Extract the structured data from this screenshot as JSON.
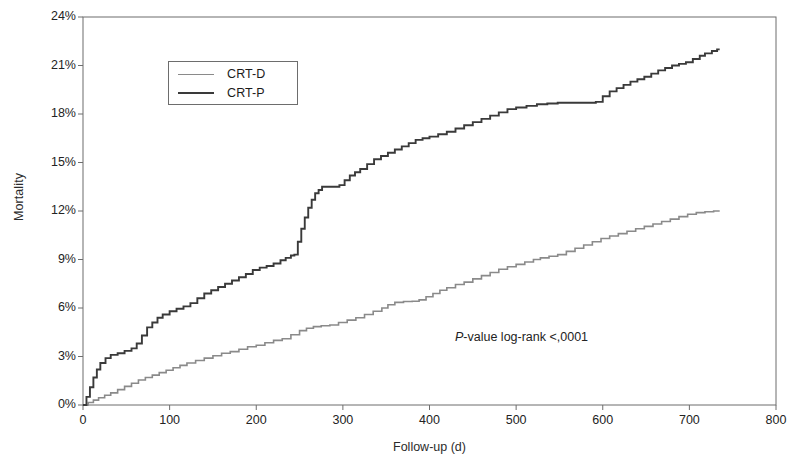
{
  "chart_data": {
    "type": "line",
    "title": "",
    "subtitle": "",
    "xlabel": "Follow-up (d)",
    "ylabel": "Mortality",
    "xlim": [
      0,
      800
    ],
    "ylim": [
      0,
      24
    ],
    "grid": false,
    "legend_position": "upper-left-inside",
    "xticks": [
      0,
      100,
      200,
      300,
      400,
      500,
      600,
      700,
      800
    ],
    "xtick_labels": [
      "0",
      "100",
      "200",
      "300",
      "400",
      "500",
      "600",
      "700",
      "800"
    ],
    "yticks": [
      0,
      3,
      6,
      9,
      12,
      15,
      18,
      21,
      24
    ],
    "ytick_labels": [
      "0%",
      "3%",
      "6%",
      "9%",
      "12%",
      "15%",
      "18%",
      "21%",
      "24%"
    ],
    "annotations": [
      {
        "name": "p-value-annotation",
        "text_italic": "P",
        "text": "-value log-rank  <,0001",
        "x": 430,
        "y": 3.9
      }
    ],
    "series": [
      {
        "name": "CRT-D",
        "color": "#8a8a8a",
        "linewidth": 1.6,
        "step": true,
        "points": [
          [
            0,
            0.0
          ],
          [
            6,
            0.15
          ],
          [
            12,
            0.3
          ],
          [
            18,
            0.45
          ],
          [
            25,
            0.6
          ],
          [
            32,
            0.75
          ],
          [
            40,
            0.95
          ],
          [
            48,
            1.15
          ],
          [
            56,
            1.35
          ],
          [
            64,
            1.55
          ],
          [
            72,
            1.7
          ],
          [
            80,
            1.85
          ],
          [
            88,
            2.0
          ],
          [
            96,
            2.15
          ],
          [
            104,
            2.3
          ],
          [
            112,
            2.45
          ],
          [
            120,
            2.6
          ],
          [
            130,
            2.75
          ],
          [
            140,
            2.9
          ],
          [
            150,
            3.05
          ],
          [
            160,
            3.2
          ],
          [
            170,
            3.3
          ],
          [
            180,
            3.45
          ],
          [
            190,
            3.6
          ],
          [
            200,
            3.7
          ],
          [
            210,
            3.85
          ],
          [
            220,
            4.0
          ],
          [
            230,
            4.1
          ],
          [
            240,
            4.35
          ],
          [
            250,
            4.6
          ],
          [
            258,
            4.75
          ],
          [
            266,
            4.85
          ],
          [
            275,
            4.9
          ],
          [
            285,
            4.95
          ],
          [
            295,
            5.1
          ],
          [
            305,
            5.25
          ],
          [
            315,
            5.4
          ],
          [
            325,
            5.6
          ],
          [
            335,
            5.8
          ],
          [
            345,
            6.0
          ],
          [
            352,
            6.2
          ],
          [
            360,
            6.35
          ],
          [
            370,
            6.4
          ],
          [
            380,
            6.42
          ],
          [
            388,
            6.5
          ],
          [
            396,
            6.7
          ],
          [
            404,
            6.9
          ],
          [
            412,
            7.1
          ],
          [
            420,
            7.25
          ],
          [
            430,
            7.45
          ],
          [
            440,
            7.6
          ],
          [
            450,
            7.8
          ],
          [
            460,
            8.0
          ],
          [
            470,
            8.2
          ],
          [
            480,
            8.4
          ],
          [
            490,
            8.55
          ],
          [
            500,
            8.7
          ],
          [
            510,
            8.85
          ],
          [
            520,
            9.0
          ],
          [
            528,
            9.1
          ],
          [
            538,
            9.2
          ],
          [
            548,
            9.3
          ],
          [
            558,
            9.5
          ],
          [
            568,
            9.7
          ],
          [
            578,
            9.9
          ],
          [
            588,
            10.1
          ],
          [
            598,
            10.3
          ],
          [
            608,
            10.45
          ],
          [
            618,
            10.6
          ],
          [
            628,
            10.75
          ],
          [
            638,
            10.9
          ],
          [
            648,
            11.05
          ],
          [
            658,
            11.2
          ],
          [
            668,
            11.35
          ],
          [
            678,
            11.5
          ],
          [
            688,
            11.65
          ],
          [
            698,
            11.8
          ],
          [
            708,
            11.9
          ],
          [
            718,
            11.95
          ],
          [
            728,
            12.0
          ],
          [
            735,
            12.0
          ]
        ]
      },
      {
        "name": "CRT-P",
        "color": "#3a3a3a",
        "linewidth": 1.9,
        "step": true,
        "points": [
          [
            0,
            0.0
          ],
          [
            4,
            0.5
          ],
          [
            8,
            1.1
          ],
          [
            12,
            1.7
          ],
          [
            16,
            2.2
          ],
          [
            20,
            2.6
          ],
          [
            26,
            2.9
          ],
          [
            32,
            3.1
          ],
          [
            40,
            3.2
          ],
          [
            48,
            3.35
          ],
          [
            56,
            3.5
          ],
          [
            62,
            3.8
          ],
          [
            68,
            4.3
          ],
          [
            74,
            4.8
          ],
          [
            80,
            5.1
          ],
          [
            86,
            5.4
          ],
          [
            92,
            5.6
          ],
          [
            100,
            5.8
          ],
          [
            108,
            5.95
          ],
          [
            116,
            6.1
          ],
          [
            124,
            6.3
          ],
          [
            132,
            6.6
          ],
          [
            140,
            6.9
          ],
          [
            148,
            7.1
          ],
          [
            156,
            7.3
          ],
          [
            164,
            7.5
          ],
          [
            172,
            7.7
          ],
          [
            180,
            7.9
          ],
          [
            188,
            8.1
          ],
          [
            196,
            8.35
          ],
          [
            204,
            8.5
          ],
          [
            212,
            8.6
          ],
          [
            220,
            8.75
          ],
          [
            228,
            8.95
          ],
          [
            234,
            9.1
          ],
          [
            240,
            9.25
          ],
          [
            244,
            9.3
          ],
          [
            248,
            10.1
          ],
          [
            252,
            10.9
          ],
          [
            256,
            11.6
          ],
          [
            260,
            12.2
          ],
          [
            264,
            12.7
          ],
          [
            268,
            13.1
          ],
          [
            272,
            13.3
          ],
          [
            276,
            13.5
          ],
          [
            285,
            13.5
          ],
          [
            292,
            13.5
          ],
          [
            296,
            13.6
          ],
          [
            302,
            13.9
          ],
          [
            308,
            14.2
          ],
          [
            314,
            14.4
          ],
          [
            320,
            14.6
          ],
          [
            328,
            14.9
          ],
          [
            336,
            15.2
          ],
          [
            344,
            15.4
          ],
          [
            352,
            15.6
          ],
          [
            360,
            15.8
          ],
          [
            368,
            16.0
          ],
          [
            376,
            16.2
          ],
          [
            384,
            16.4
          ],
          [
            392,
            16.5
          ],
          [
            400,
            16.6
          ],
          [
            410,
            16.75
          ],
          [
            420,
            16.9
          ],
          [
            430,
            17.1
          ],
          [
            440,
            17.3
          ],
          [
            450,
            17.5
          ],
          [
            460,
            17.7
          ],
          [
            470,
            17.9
          ],
          [
            480,
            18.1
          ],
          [
            490,
            18.3
          ],
          [
            500,
            18.4
          ],
          [
            512,
            18.5
          ],
          [
            524,
            18.6
          ],
          [
            536,
            18.65
          ],
          [
            548,
            18.7
          ],
          [
            560,
            18.7
          ],
          [
            572,
            18.7
          ],
          [
            584,
            18.7
          ],
          [
            592,
            18.75
          ],
          [
            600,
            19.1
          ],
          [
            608,
            19.4
          ],
          [
            616,
            19.6
          ],
          [
            624,
            19.8
          ],
          [
            632,
            20.0
          ],
          [
            640,
            20.15
          ],
          [
            648,
            20.3
          ],
          [
            656,
            20.5
          ],
          [
            664,
            20.7
          ],
          [
            672,
            20.85
          ],
          [
            680,
            21.0
          ],
          [
            688,
            21.1
          ],
          [
            696,
            21.2
          ],
          [
            704,
            21.4
          ],
          [
            712,
            21.6
          ],
          [
            718,
            21.75
          ],
          [
            726,
            21.9
          ],
          [
            732,
            22.0
          ],
          [
            735,
            22.0
          ]
        ]
      }
    ]
  },
  "legend": {
    "entries": [
      {
        "label": "CRT-D",
        "color": "#8a8a8a",
        "linewidth": 1.7
      },
      {
        "label": "CRT-P",
        "color": "#3a3a3a",
        "linewidth": 2.2
      }
    ]
  },
  "axes": {
    "frame_color": "#6d6d6d"
  }
}
